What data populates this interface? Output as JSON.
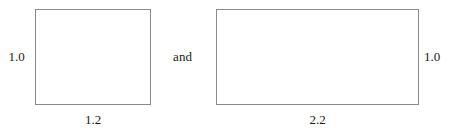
{
  "figure": {
    "background_color": "#ffffff",
    "stroke_color": "#8a8a8a",
    "text_color": "#1a1a1a",
    "conjunction": "and",
    "shapes": [
      {
        "name": "rectangle-a",
        "kind": "rectangle",
        "height_label": "1.0",
        "width_label": "1.2",
        "height_label_side": "left",
        "width_label_side": "bottom"
      },
      {
        "name": "rectangle-b",
        "kind": "rectangle",
        "height_label": "1.0",
        "width_label": "2.2",
        "height_label_side": "right",
        "width_label_side": "bottom"
      }
    ]
  },
  "chart_data": {
    "type": "diagram",
    "title": "",
    "subtitle": "",
    "xlabel": "",
    "ylabel": "",
    "annotations": [
      "1.0",
      "1.2",
      "and",
      "2.2",
      "1.0"
    ],
    "items": [
      {
        "label": "rectangle-a",
        "width": 1.2,
        "height": 1.0
      },
      {
        "label": "rectangle-b",
        "width": 2.2,
        "height": 1.0
      }
    ],
    "grid": false,
    "legend": "none"
  }
}
